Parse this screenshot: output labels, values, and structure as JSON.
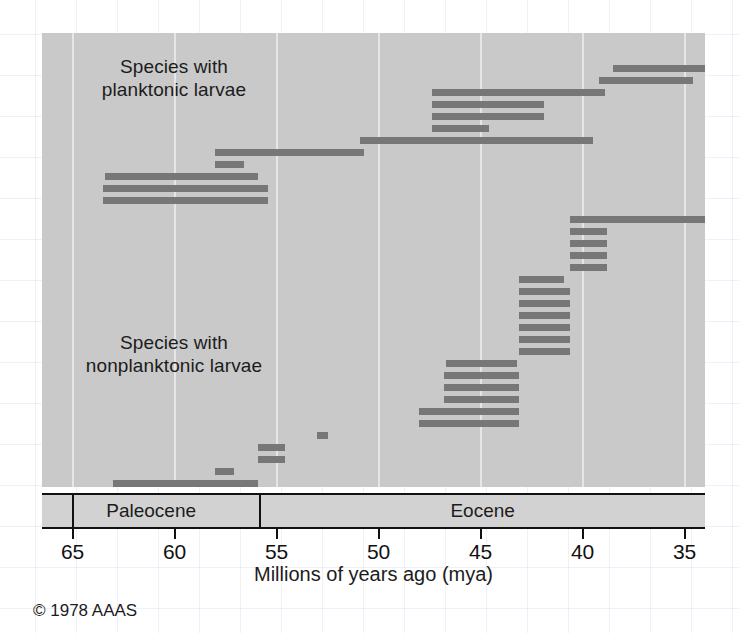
{
  "credit": "© 1978 AAAS",
  "axis": {
    "title": "Millions of years ago (mya)",
    "ticks": [
      65,
      60,
      55,
      50,
      45,
      40,
      35
    ],
    "tick_labels": [
      "65",
      "60",
      "55",
      "50",
      "45",
      "40",
      "35"
    ],
    "min": 35,
    "max": 66.5,
    "direction": "decreasing-left-to-right"
  },
  "epochs": [
    {
      "name": "Paleocene",
      "start": 66.5,
      "end": 55.8
    },
    {
      "name": "Eocene",
      "start": 55.8,
      "end": 34.0
    }
  ],
  "groups": [
    {
      "id": "planktonic",
      "label": "Species with\nplanktonic larvae"
    },
    {
      "id": "nonplanktonic",
      "label": "Species with\nnonplanktonic larvae"
    }
  ],
  "chart_data": {
    "type": "bar",
    "orientation": "horizontal",
    "title": "",
    "subtitle": "",
    "xlabel": "Millions of years ago (mya)",
    "ylabel": "",
    "xlim": [
      66.5,
      34.0
    ],
    "xticks": [
      65,
      60,
      55,
      50,
      45,
      40,
      35
    ],
    "grid": "vertical",
    "legend": "none",
    "bar_color": "#777777",
    "panel_color": "#c9c9c9",
    "series": [
      {
        "name": "Species with planktonic larvae",
        "values": [
          {
            "start": 38.5,
            "end": 33.7
          },
          {
            "start": 39.2,
            "end": 34.6
          },
          {
            "start": 47.4,
            "end": 38.9
          },
          {
            "start": 47.4,
            "end": 41.9
          },
          {
            "start": 47.4,
            "end": 41.9
          },
          {
            "start": 47.4,
            "end": 44.6
          },
          {
            "start": 50.9,
            "end": 39.5
          },
          {
            "start": 58.0,
            "end": 50.7
          },
          {
            "start": 58.0,
            "end": 56.6
          },
          {
            "start": 63.4,
            "end": 55.9
          },
          {
            "start": 63.5,
            "end": 55.4
          },
          {
            "start": 63.5,
            "end": 55.4
          }
        ]
      },
      {
        "name": "Species with nonplanktonic larvae",
        "values": [
          {
            "start": 40.6,
            "end": 33.7
          },
          {
            "start": 40.6,
            "end": 38.8
          },
          {
            "start": 40.6,
            "end": 38.8
          },
          {
            "start": 40.6,
            "end": 38.8
          },
          {
            "start": 40.6,
            "end": 38.8
          },
          {
            "start": 43.1,
            "end": 40.9
          },
          {
            "start": 43.1,
            "end": 40.6
          },
          {
            "start": 43.1,
            "end": 40.6
          },
          {
            "start": 43.1,
            "end": 40.6
          },
          {
            "start": 43.1,
            "end": 40.6
          },
          {
            "start": 43.1,
            "end": 40.6
          },
          {
            "start": 43.1,
            "end": 40.6
          },
          {
            "start": 46.7,
            "end": 43.2
          },
          {
            "start": 46.8,
            "end": 43.1
          },
          {
            "start": 46.8,
            "end": 43.1
          },
          {
            "start": 46.8,
            "end": 43.1
          },
          {
            "start": 48.0,
            "end": 43.1
          },
          {
            "start": 48.0,
            "end": 43.1
          },
          {
            "start": 53.0,
            "end": 52.5
          },
          {
            "start": 55.9,
            "end": 54.6
          },
          {
            "start": 55.9,
            "end": 54.6
          },
          {
            "start": 58.0,
            "end": 57.1
          },
          {
            "start": 63.0,
            "end": 55.9
          },
          {
            "start": 63.2,
            "end": 60.6
          },
          {
            "start": 63.2,
            "end": 60.6
          }
        ]
      }
    ]
  }
}
